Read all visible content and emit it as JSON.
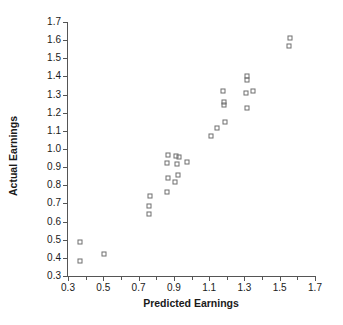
{
  "chart_data": {
    "type": "scatter",
    "title": "",
    "xlabel": "Predicted Earnings",
    "ylabel": "Actual Earnings",
    "xlim": [
      0.3,
      1.7
    ],
    "ylim": [
      0.3,
      1.7
    ],
    "xticks": [
      0.3,
      0.5,
      0.7,
      0.9,
      1.1,
      1.3,
      1.5,
      1.7
    ],
    "xtick_labels": [
      "0.3",
      "0.5",
      "0.7",
      "0.9",
      "1.1",
      "1.3",
      "1.5",
      "1.7"
    ],
    "x_minor_ticks": [
      0.4,
      0.6,
      0.8,
      1.0,
      1.2,
      1.4,
      1.6
    ],
    "yticks": [
      0.3,
      0.4,
      0.5,
      0.6,
      0.7,
      0.8,
      0.9,
      1.0,
      1.1,
      1.2,
      1.3,
      1.4,
      1.5,
      1.6,
      1.7
    ],
    "ytick_labels": [
      "0.3",
      "0.4",
      "0.5",
      "0.6",
      "0.7",
      "0.8",
      "0.9",
      "1.0",
      "1.1",
      "1.2",
      "1.3",
      "1.4",
      "1.5",
      "1.6",
      "1.7"
    ],
    "grid": false,
    "legend": null,
    "marker": "open-square",
    "marker_color": "#6e6e6e",
    "points": [
      {
        "x": 0.37,
        "y": 0.49
      },
      {
        "x": 0.37,
        "y": 0.385
      },
      {
        "x": 0.505,
        "y": 0.42
      },
      {
        "x": 0.765,
        "y": 0.74
      },
      {
        "x": 0.757,
        "y": 0.685
      },
      {
        "x": 0.757,
        "y": 0.64
      },
      {
        "x": 0.868,
        "y": 0.965
      },
      {
        "x": 0.862,
        "y": 0.925
      },
      {
        "x": 0.866,
        "y": 0.84
      },
      {
        "x": 0.862,
        "y": 0.765
      },
      {
        "x": 0.912,
        "y": 0.96
      },
      {
        "x": 0.928,
        "y": 0.955
      },
      {
        "x": 0.918,
        "y": 0.915
      },
      {
        "x": 0.924,
        "y": 0.855
      },
      {
        "x": 0.906,
        "y": 0.82
      },
      {
        "x": 0.976,
        "y": 0.928
      },
      {
        "x": 1.108,
        "y": 1.07
      },
      {
        "x": 1.146,
        "y": 1.115
      },
      {
        "x": 1.178,
        "y": 1.32
      },
      {
        "x": 1.186,
        "y": 1.26
      },
      {
        "x": 1.182,
        "y": 1.245
      },
      {
        "x": 1.192,
        "y": 1.15
      },
      {
        "x": 1.312,
        "y": 1.4
      },
      {
        "x": 1.312,
        "y": 1.382
      },
      {
        "x": 1.308,
        "y": 1.308
      },
      {
        "x": 1.348,
        "y": 1.32
      },
      {
        "x": 1.314,
        "y": 1.225
      },
      {
        "x": 1.556,
        "y": 1.612
      },
      {
        "x": 1.554,
        "y": 1.568
      }
    ]
  }
}
